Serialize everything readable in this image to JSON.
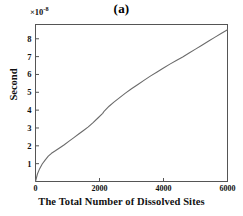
{
  "chart_data": {
    "type": "line",
    "title": "(a)",
    "xlabel": "The Total Number of Dissolved Sites",
    "ylabel": "Second",
    "y_multiplier": "×10",
    "y_exponent": "-8",
    "xlim": [
      0,
      6000
    ],
    "ylim": [
      0,
      8.8
    ],
    "xticks": [
      0,
      2000,
      4000,
      6000
    ],
    "xtick_labels": [
      "0",
      "2000",
      "4000",
      "6000"
    ],
    "yticks": [
      1,
      2,
      3,
      4,
      5,
      6,
      7,
      8
    ],
    "ytick_labels": [
      "1",
      "2",
      "3",
      "4",
      "5",
      "6",
      "7",
      "8"
    ],
    "grid": false,
    "legend": null,
    "line_color": "#6b6b6b",
    "frame_color": "#555555",
    "series": [
      {
        "name": "elapsed-time",
        "x": [
          0,
          60,
          130,
          210,
          300,
          400,
          500,
          620,
          750,
          900,
          1050,
          1200,
          1350,
          1500,
          1650,
          1800,
          1950,
          2100,
          2150,
          2300,
          2450,
          2600,
          2800,
          3000,
          3200,
          3400,
          3600,
          3800,
          4000,
          4200,
          4400,
          4600,
          4800,
          5000,
          5200,
          5400,
          5600,
          5800,
          6000
        ],
        "y": [
          0.0,
          0.42,
          0.72,
          0.98,
          1.2,
          1.42,
          1.58,
          1.72,
          1.88,
          2.06,
          2.26,
          2.46,
          2.66,
          2.86,
          3.06,
          3.3,
          3.56,
          3.82,
          3.95,
          4.22,
          4.45,
          4.66,
          4.94,
          5.2,
          5.44,
          5.68,
          5.92,
          6.14,
          6.36,
          6.58,
          6.78,
          6.98,
          7.2,
          7.42,
          7.64,
          7.86,
          8.08,
          8.3,
          8.5
        ]
      }
    ]
  }
}
